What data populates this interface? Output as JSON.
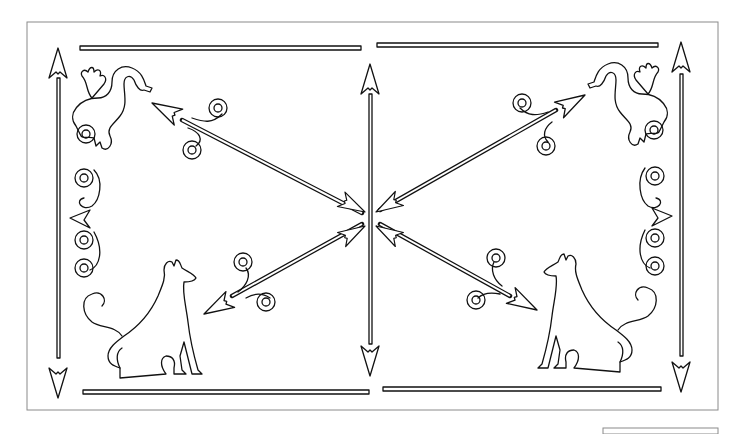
{
  "artwork": {
    "title": "Decorative line-art panel",
    "style": "outline stencil",
    "colors": {
      "background": "#ffffff",
      "line": "#111111",
      "frame": "#8a8a8a"
    },
    "elements": {
      "top_bars": 2,
      "bottom_bars": 2,
      "vertical_arrows": [
        "left",
        "center",
        "right"
      ],
      "diagonal_arrows": 4,
      "dragons": [
        "top-left",
        "top-right"
      ],
      "dogs": [
        "bottom-left",
        "bottom-right"
      ],
      "scroll_ornaments": [
        "left-border",
        "right-border",
        "arrow-fletchings"
      ]
    }
  }
}
